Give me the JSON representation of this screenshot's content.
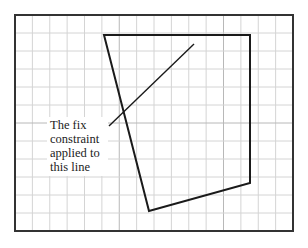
{
  "diagram": {
    "type": "sketch-with-constraint",
    "frame": {
      "x": 15,
      "y": 15,
      "width": 278,
      "height": 216,
      "stroke": "#333333"
    },
    "grid": {
      "origin_x": 15,
      "origin_y": 15,
      "columns": 16,
      "rows": 12,
      "cell_w": 17.375,
      "cell_h": 18,
      "minor_color": "#d4d4d4",
      "major_color": "#b8b8b8",
      "major_every": 6
    },
    "polygon": {
      "name": "quadrilateral",
      "stroke": "#1a1a1a",
      "stroke_width": 2,
      "points": [
        [
          104,
          35
        ],
        [
          250,
          35
        ],
        [
          250,
          183
        ],
        [
          149,
          211
        ]
      ]
    },
    "constraint_line": {
      "name": "fixed-line",
      "stroke": "#1a1a1a",
      "stroke_width": 1.4,
      "x1": 109,
      "y1": 126,
      "x2": 194,
      "y2": 44
    },
    "annotation": {
      "lines": [
        "The fix",
        "constraint",
        "applied to",
        "this line"
      ]
    }
  }
}
